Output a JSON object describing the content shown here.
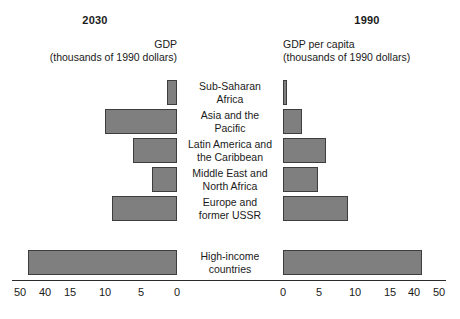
{
  "header": {
    "left_year": "2030",
    "right_year": "1990",
    "left_caption_line1": "GDP",
    "left_caption_line2": "(thousands of 1990 dollars)",
    "right_caption_line1": "GDP per capita",
    "right_caption_line2": "(thousands of 1990 dollars)"
  },
  "colors": {
    "bar_fill": "#7f7f7f",
    "bar_stroke": "#3d3d3d",
    "axis": "#2b2b2b",
    "text": "#1a1a1a",
    "background": "#ffffff"
  },
  "chart_data": {
    "type": "bar",
    "title": "",
    "subtitle": "",
    "orientation": "horizontal",
    "layout": "diverging-back-to-back",
    "xlabel": "",
    "ylabel": "",
    "grid": false,
    "legend": false,
    "categories": [
      "Sub-Saharan\nAfrica",
      "Asia and the\nPacific",
      "Latin America and\nthe Caribbean",
      "Middle East and\nNorth Africa",
      "Europe and\nformer USSR",
      "High-income\ncountries"
    ],
    "axes": {
      "left": {
        "name": "2030",
        "label": "GDP",
        "units": "thousands of 1990 dollars",
        "direction": "leftward",
        "scale": "broken",
        "tick_values": [
          50,
          40,
          15,
          10,
          5,
          0
        ],
        "tick_labels": [
          "50",
          "40",
          "15",
          "10",
          "5",
          "0"
        ],
        "tick_x_px": [
          20,
          45,
          70,
          105,
          141,
          177
        ]
      },
      "right": {
        "name": "1990",
        "label": "GDP per capita",
        "units": "thousands of 1990 dollars",
        "direction": "rightward",
        "scale": "broken",
        "tick_values": [
          0,
          5,
          10,
          15,
          40,
          50
        ],
        "tick_labels": [
          "0",
          "5",
          "10",
          "15",
          "40",
          "50"
        ],
        "tick_x_px": [
          283,
          319,
          355,
          390,
          414,
          439
        ]
      }
    },
    "series": [
      {
        "name": "GDP",
        "axis": "left",
        "values": [
          1.3,
          10.0,
          4.6,
          3.0,
          8.3,
          45.0
        ]
      },
      {
        "name": "GDP per capita",
        "axis": "right",
        "values": [
          0.6,
          2.7,
          6.0,
          4.9,
          9.0,
          43.0
        ]
      }
    ],
    "bars": [
      {
        "category": "Sub-Saharan Africa",
        "left_value": 1.3,
        "right_value": 0.6
      },
      {
        "category": "Asia and the Pacific",
        "left_value": 10.0,
        "right_value": 2.7
      },
      {
        "category": "Latin America and the Caribbean",
        "left_value": 4.6,
        "right_value": 6.0
      },
      {
        "category": "Middle East and North Africa",
        "left_value": 3.0,
        "right_value": 4.9
      },
      {
        "category": "Europe and former USSR",
        "left_value": 8.3,
        "right_value": 9.0
      },
      {
        "category": "High-income countries",
        "left_value": 45.0,
        "right_value": 43.0
      }
    ],
    "geometry": {
      "left_baseline_px": 177,
      "right_baseline_px": 283,
      "bar_height_px": 25,
      "row_top_px": [
        80,
        109,
        138,
        167,
        196,
        250
      ],
      "left_bar_left_px": [
        167,
        105,
        133,
        152,
        112,
        28
      ],
      "right_bar_right_px": [
        287,
        302,
        326,
        318,
        348,
        422
      ]
    }
  }
}
